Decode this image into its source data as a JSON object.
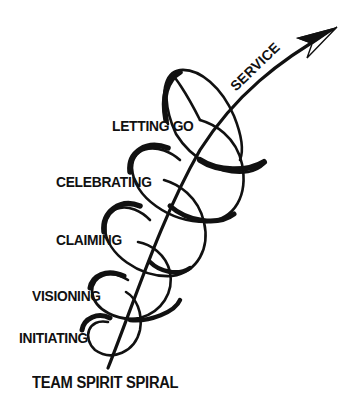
{
  "diagram": {
    "title": "TEAM SPIRIT SPIRAL",
    "arrow_label": "SERVICE",
    "stages": [
      {
        "label": "INITIATING"
      },
      {
        "label": "VISIONING"
      },
      {
        "label": "CLAIMING"
      },
      {
        "label": "CELEBRATING"
      },
      {
        "label": "LETTING GO"
      }
    ],
    "colors": {
      "ink": "#111111",
      "background": "#ffffff"
    }
  }
}
